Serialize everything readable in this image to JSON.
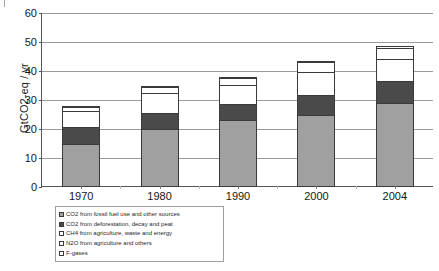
{
  "chart": {
    "y_axis_title": "GtCO2-eq / yr",
    "y_ticks": [
      "0",
      "10",
      "20",
      "30",
      "40",
      "50",
      "60"
    ],
    "x_ticks": [
      "1970",
      "1980",
      "1990",
      "2000",
      "2004"
    ]
  },
  "legend": {
    "items": [
      {
        "label": "CO2 from fossil fuel use and other sources",
        "color": "#a0a0a0"
      },
      {
        "label": "CO2 from deforestation, decay and peat",
        "color": "#4a4a4a"
      },
      {
        "label": "CH4 from agriculture, waste and energy",
        "color": "#ffffff"
      },
      {
        "label": "N2O from agriculture and others",
        "color": "#ffffff"
      },
      {
        "label": "F-gases",
        "color": "#ffffff"
      }
    ]
  },
  "chart_data": {
    "type": "bar",
    "subtype": "stacked",
    "title": "",
    "xlabel": "",
    "ylabel": "GtCO2-eq / yr",
    "ylim": [
      0,
      60
    ],
    "ytick_step": 10,
    "grid": true,
    "legend_position": "below-axes-left",
    "categories": [
      "1970",
      "1980",
      "1990",
      "2000",
      "2004"
    ],
    "series": [
      {
        "name": "CO2 from fossil fuel use and other sources",
        "color": "#a0a0a0",
        "values": [
          15.0,
          20.0,
          23.0,
          25.0,
          29.0
        ]
      },
      {
        "name": "CO2 from deforestation, decay and peat",
        "color": "#4a4a4a",
        "values": [
          6.0,
          6.0,
          6.0,
          7.0,
          8.0
        ]
      },
      {
        "name": "CH4 from agriculture, waste and energy",
        "color": "#ffffff",
        "values": [
          6.0,
          7.0,
          7.0,
          8.5,
          8.0
        ]
      },
      {
        "name": "N2O from agriculture and others",
        "color": "#ffffff",
        "values": [
          1.5,
          2.5,
          2.5,
          3.5,
          4.0
        ]
      },
      {
        "name": "F-gases",
        "color": "#ffffff",
        "values": [
          0.5,
          0.5,
          0.9,
          1.0,
          0.9
        ]
      }
    ],
    "totals": [
      29.0,
      36.0,
      39.4,
      45.0,
      49.9
    ]
  }
}
